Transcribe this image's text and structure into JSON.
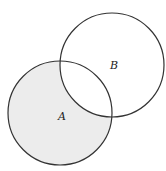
{
  "diagram": {
    "type": "venn",
    "shaded_region": "A minus B",
    "colors": {
      "stroke": "#333333",
      "shade": "#ececec",
      "background": "#ffffff"
    },
    "sets": [
      {
        "id": "A",
        "label": "A",
        "cx": 60,
        "cy": 113,
        "r": 52
      },
      {
        "id": "B",
        "label": "B",
        "cx": 112,
        "cy": 65,
        "r": 52
      }
    ]
  }
}
